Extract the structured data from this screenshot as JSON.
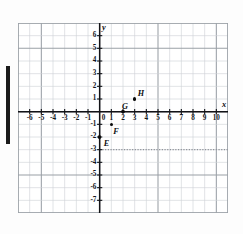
{
  "figure": {
    "kind": "coordinate-plane",
    "x_axis_name": "x",
    "y_axis_name": "y"
  },
  "chart_data": {
    "type": "scatter",
    "title": "",
    "xlabel": "x",
    "ylabel": "y",
    "xlim": [
      -7,
      11
    ],
    "ylim": [
      -8,
      7
    ],
    "grid": true,
    "legend": "none",
    "x_ticks": [
      -6,
      -5,
      -4,
      -3,
      -2,
      -1,
      0,
      1,
      2,
      3,
      4,
      5,
      6,
      7,
      8,
      9,
      10
    ],
    "x_tick_labels": [
      "-6",
      "-5",
      "-4",
      "-3",
      "-2",
      "-1",
      "0",
      "1",
      "2",
      "3",
      "4",
      "5",
      "6",
      "7",
      "8",
      "9",
      "10"
    ],
    "y_ticks": [
      6,
      5,
      4,
      3,
      2,
      1,
      -1,
      -2,
      -3,
      -4,
      -5,
      -6,
      -7
    ],
    "y_tick_labels": [
      "6",
      "5",
      "4",
      "3",
      "2",
      "1",
      "-1",
      "-2",
      "-3",
      "-4",
      "-5",
      "-6",
      "-7"
    ],
    "origin_label": "0",
    "points": [
      {
        "label": "E",
        "x": 0,
        "y": -2,
        "label_dx": 4,
        "label_dy": 3
      },
      {
        "label": "F",
        "x": 1,
        "y": -1,
        "label_dx": 2,
        "label_dy": 4
      },
      {
        "label": "G",
        "x": 2,
        "y": 0,
        "label_dx": -1,
        "label_dy": -9
      },
      {
        "label": "H",
        "x": 3,
        "y": 1,
        "label_dx": 3,
        "label_dy": -9
      }
    ],
    "annotations": [
      {
        "type": "dotted-horizontal-line",
        "y": -3,
        "x_start": 0,
        "x_end": 11
      }
    ],
    "colors": {
      "grid_minor": "#cfd2d6",
      "grid_major": "#9aa0a6",
      "axis": "#121317",
      "point": "#0a0a0a",
      "dotted_line": "#8d9298",
      "background": "#ffffff"
    }
  }
}
